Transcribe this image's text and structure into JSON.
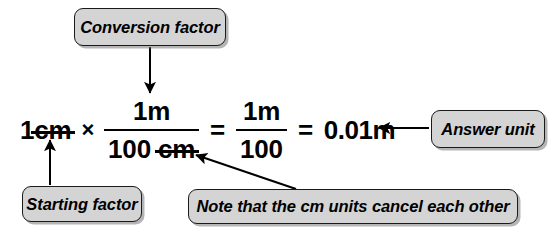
{
  "figure": {
    "background_color": "#ffffff",
    "box_fill_color": "#d4d4d4",
    "box_border_color": "#1a1a1a",
    "text_color": "#000000"
  },
  "callouts": {
    "conversion_factor": "Conversion factor",
    "starting_factor": "Starting factor",
    "answer_unit": "Answer unit",
    "note": "Note that the cm units cancel each other"
  },
  "equation": {
    "starting_value": "1",
    "starting_unit": "cm",
    "multiply_symbol": "×",
    "equals_symbol": "=",
    "factor": {
      "numerator": "1m",
      "denominator_number": "100",
      "denominator_unit": "cm"
    },
    "simplified": {
      "numerator": "1m",
      "denominator": "100"
    },
    "result": "0.01m"
  }
}
